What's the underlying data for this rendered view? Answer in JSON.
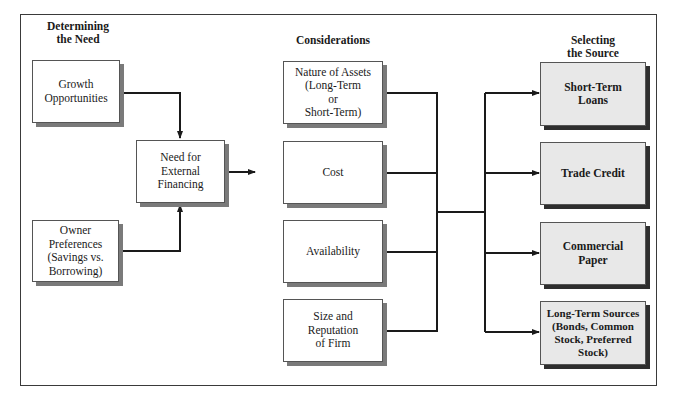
{
  "headings": {
    "need": "Determining\nthe Need",
    "considerations": "Considerations",
    "source": "Selecting\nthe Source"
  },
  "need_boxes": {
    "growth": "Growth\nOpportunities",
    "owner": "Owner\nPreferences\n(Savings vs.\nBorrowing)",
    "external": "Need for\nExternal\nFinancing"
  },
  "considerations": [
    "Nature of Assets\n(Long-Term\nor\nShort-Term)",
    "Cost",
    "Availability",
    "Size and\nReputation\nof Firm"
  ],
  "sources": [
    "Short-Term\nLoans",
    "Trade Credit",
    "Commercial\nPaper",
    "Long-Term Sources\n(Bonds, Common\nStock, Preferred\nStock)"
  ],
  "colors": {
    "line": "#1a1a1a",
    "source_fill": "#e8e8e8",
    "consideration_fill": "#ffffff"
  }
}
